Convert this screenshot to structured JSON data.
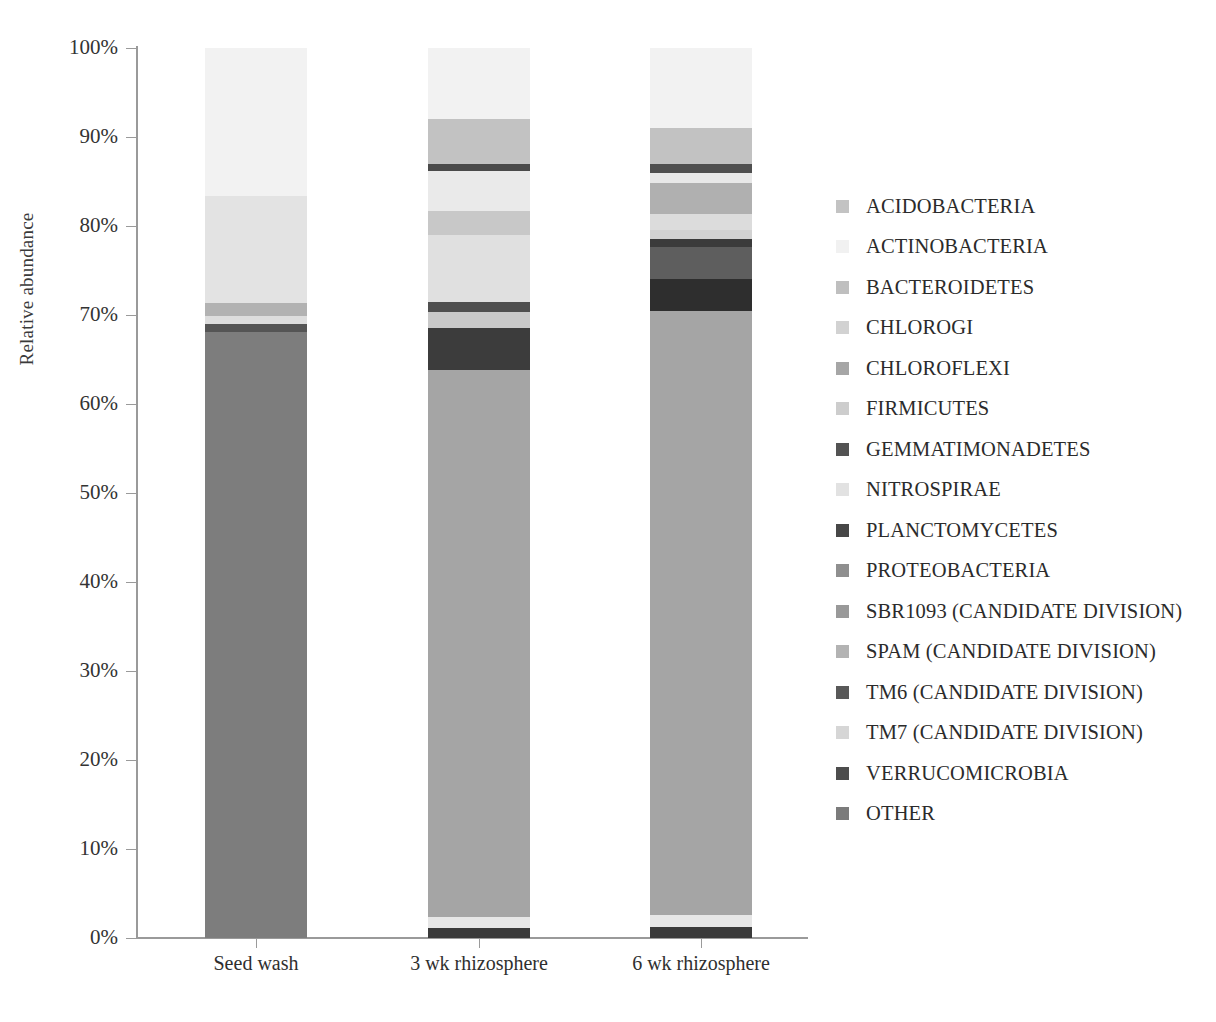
{
  "chart_data": {
    "type": "bar",
    "subtype": "stacked-100-percent",
    "title": "",
    "xlabel": "",
    "ylabel": "Relative abundance",
    "ylim": [
      0,
      100
    ],
    "ytick_labels": [
      "100%",
      "90%",
      "80%",
      "70%",
      "60%",
      "50%",
      "40%",
      "30%",
      "20%",
      "10%",
      "0%"
    ],
    "ytick_values": [
      100,
      90,
      80,
      70,
      60,
      50,
      40,
      30,
      20,
      10,
      0
    ],
    "grid": false,
    "legend_position": "right",
    "categories": [
      "Seed wash",
      "3 wk rhizosphere",
      "6 wk rhizosphere"
    ],
    "series": [
      {
        "name": "ACIDOBACTERIA",
        "color": "#bdbdbd",
        "values": [
          0.4,
          1.2,
          1.4
        ]
      },
      {
        "name": "ACTINOBACTERIA",
        "color": "#f2f2f2",
        "values": [
          16.5,
          13.5,
          14.0
        ]
      },
      {
        "name": "BACTEROIDETES",
        "color": "#c6c6c6",
        "values": [
          0.3,
          5.0,
          5.2
        ]
      },
      {
        "name": "CHLOROGI",
        "color": "#d3d3d3",
        "values": [
          0.2,
          0.4,
          0.6
        ]
      },
      {
        "name": "CHLOROFLEXI",
        "color": "#a8a8a8",
        "values": [
          0.3,
          1.0,
          2.7
        ]
      },
      {
        "name": "FIRMICUTES",
        "color": "#cfcfcf",
        "values": [
          0.3,
          2.6,
          1.6
        ]
      },
      {
        "name": "GEMMATIMONADETES",
        "color": "#565656",
        "values": [
          0.2,
          0.7,
          0.9
        ]
      },
      {
        "name": "NITROSPIRAE",
        "color": "#e3e3e3",
        "values": [
          12.0,
          9.5,
          4.6
        ]
      },
      {
        "name": "PLANCTOMYCETES",
        "color": "#4a4a4a",
        "values": [
          0.3,
          0.8,
          1.0
        ]
      },
      {
        "name": "PROTEOBACTERIA",
        "color": "#9d9d9d",
        "values": [
          1.2,
          6.0,
          7.4
        ]
      },
      {
        "name": "SBR1093 (CANDIDATE DIVISION)",
        "color": "#9a9a9a",
        "values": [
          0.2,
          0.5,
          0.4
        ]
      },
      {
        "name": "SPAM (CANDIDATE DIVISION)",
        "color": "#b5b5b5",
        "values": [
          0.3,
          0.4,
          0.4
        ]
      },
      {
        "name": "TM6 (CANDIDATE DIVISION)",
        "color": "#5c5c5c",
        "values": [
          0.5,
          3.2,
          2.5
        ]
      },
      {
        "name": "TM7 (CANDIDATE DIVISION)",
        "color": "#d8d8d8",
        "values": [
          0.4,
          1.6,
          1.5
        ]
      },
      {
        "name": "VERRUCOMICROBIA",
        "color": "#4f4f4f",
        "values": [
          0.3,
          1.0,
          1.1
        ]
      },
      {
        "name": "OTHER",
        "color": "#7d7d7d",
        "values": [
          66.6,
          52.6,
          54.7
        ]
      }
    ],
    "bars": [
      {
        "category": "Seed wash",
        "segments": [
          {
            "name": "ACTINOBACTERIA",
            "from": 83.4,
            "to": 100.0,
            "color": "#f2f2f2"
          },
          {
            "name": "NITROSPIRAE",
            "from": 71.4,
            "to": 83.4,
            "color": "#e3e3e3"
          },
          {
            "name": "PROTEOBACTERIA",
            "from": 69.9,
            "to": 71.4,
            "color": "#b2b2b2"
          },
          {
            "name": "TM7 (CANDIDATE DIVISION)",
            "from": 69.0,
            "to": 69.9,
            "color": "#dddddd"
          },
          {
            "name": "GEMMATIMONADETES",
            "from": 68.1,
            "to": 69.0,
            "color": "#555555"
          },
          {
            "name": "OTHER",
            "from": 0.0,
            "to": 68.1,
            "color": "#7d7d7d"
          }
        ]
      },
      {
        "category": "3 wk rhizosphere",
        "segments": [
          {
            "name": "ACTINOBACTERIA",
            "from": 92.0,
            "to": 100.0,
            "color": "#f2f2f2"
          },
          {
            "name": "BACTEROIDETES",
            "from": 87.0,
            "to": 92.0,
            "color": "#c2c2c2"
          },
          {
            "name": "PLANCTOMYCETES",
            "from": 86.2,
            "to": 87.0,
            "color": "#4a4a4a"
          },
          {
            "name": "NITROSPIRAE",
            "from": 81.7,
            "to": 86.2,
            "color": "#eaeaea"
          },
          {
            "name": "ACIDOBACTERIA",
            "from": 79.0,
            "to": 81.7,
            "color": "#c8c8c8"
          },
          {
            "name": "SPAM (CANDIDATE DIVISION)",
            "from": 71.5,
            "to": 79.0,
            "color": "#e0e0e0"
          },
          {
            "name": "VERRUCOMICROBIA",
            "from": 70.3,
            "to": 71.5,
            "color": "#4f4f4f"
          },
          {
            "name": "FIRMICUTES",
            "from": 68.5,
            "to": 70.3,
            "color": "#c9c9c9"
          },
          {
            "name": "TM6 (CANDIDATE DIVISION)",
            "from": 63.8,
            "to": 68.5,
            "color": "#3c3c3c"
          },
          {
            "name": "OTHER",
            "from": 2.4,
            "to": 63.8,
            "color": "#a5a5a5"
          },
          {
            "name": "CHLOROGI",
            "from": 1.1,
            "to": 2.4,
            "color": "#e6e6e6"
          },
          {
            "name": "CHLOROFLEXI",
            "from": 0.0,
            "to": 1.1,
            "color": "#3a3a3a"
          }
        ]
      },
      {
        "category": "6 wk rhizosphere",
        "segments": [
          {
            "name": "ACTINOBACTERIA",
            "from": 91.0,
            "to": 100.0,
            "color": "#f2f2f2"
          },
          {
            "name": "BACTEROIDETES",
            "from": 87.0,
            "to": 91.0,
            "color": "#c2c2c2"
          },
          {
            "name": "PLANCTOMYCETES",
            "from": 86.0,
            "to": 87.0,
            "color": "#4f4f4f"
          },
          {
            "name": "NITROSPIRAE",
            "from": 84.8,
            "to": 86.0,
            "color": "#e8e8e8"
          },
          {
            "name": "ACIDOBACTERIA",
            "from": 81.3,
            "to": 84.8,
            "color": "#b0b0b0"
          },
          {
            "name": "SPAM (CANDIDATE DIVISION)",
            "from": 79.6,
            "to": 81.3,
            "color": "#dcdcdc"
          },
          {
            "name": "FIRMICUTES",
            "from": 78.5,
            "to": 79.6,
            "color": "#d2d2d2"
          },
          {
            "name": "VERRUCOMICROBIA",
            "from": 77.6,
            "to": 78.5,
            "color": "#3b3b3b"
          },
          {
            "name": "CHLOROFLEXI",
            "from": 74.0,
            "to": 77.6,
            "color": "#5e5e5e"
          },
          {
            "name": "TM6 (CANDIDATE DIVISION)",
            "from": 70.4,
            "to": 74.0,
            "color": "#2e2e2e"
          },
          {
            "name": "OTHER",
            "from": 2.6,
            "to": 70.4,
            "color": "#a5a5a5"
          },
          {
            "name": "CHLOROGI",
            "from": 1.2,
            "to": 2.6,
            "color": "#e6e6e6"
          },
          {
            "name": "PROTEOBACTERIA",
            "from": 0.0,
            "to": 1.2,
            "color": "#3a3a3a"
          }
        ]
      }
    ]
  },
  "legend": {
    "items": [
      {
        "label": "ACIDOBACTERIA",
        "color": "#c3c3c3"
      },
      {
        "label": "ACTINOBACTERIA",
        "color": "#f1f1f1"
      },
      {
        "label": "BACTEROIDETES",
        "color": "#bfbfbf"
      },
      {
        "label": "CHLOROGI",
        "color": "#d2d2d2"
      },
      {
        "label": "CHLOROFLEXI",
        "color": "#a6a6a6"
      },
      {
        "label": "FIRMICUTES",
        "color": "#cdcdcd"
      },
      {
        "label": "GEMMATIMONADETES",
        "color": "#535353"
      },
      {
        "label": "NITROSPIRAE",
        "color": "#e2e2e2"
      },
      {
        "label": "PLANCTOMYCETES",
        "color": "#474747"
      },
      {
        "label": "PROTEOBACTERIA",
        "color": "#8f8f8f"
      },
      {
        "label": "SBR1093 (CANDIDATE DIVISION)",
        "color": "#999999"
      },
      {
        "label": "SPAM (CANDIDATE DIVISION)",
        "color": "#b3b3b3"
      },
      {
        "label": "TM6 (CANDIDATE DIVISION)",
        "color": "#595959"
      },
      {
        "label": "TM7 (CANDIDATE DIVISION)",
        "color": "#d6d6d6"
      },
      {
        "label": "VERRUCOMICROBIA",
        "color": "#4d4d4d"
      },
      {
        "label": "OTHER",
        "color": "#7b7b7b"
      }
    ]
  }
}
